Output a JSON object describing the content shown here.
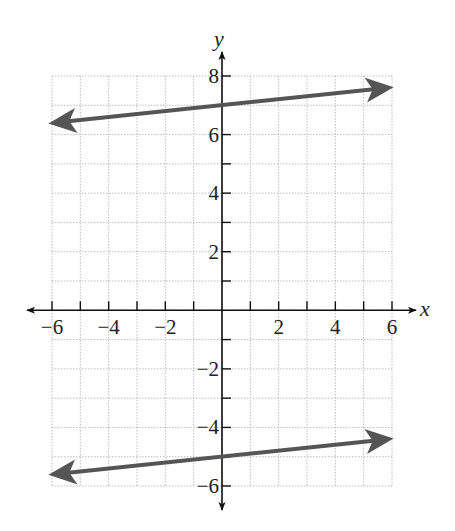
{
  "chart_data": {
    "type": "line",
    "title": "",
    "xlabel": "x",
    "ylabel": "y",
    "xlim": [
      -6,
      6
    ],
    "ylim": [
      -6,
      8
    ],
    "grid": true,
    "grid_step": 1,
    "x_ticks": [
      -6,
      -4,
      -2,
      2,
      4,
      6
    ],
    "y_ticks": [
      -6,
      -4,
      -2,
      2,
      4,
      6,
      8
    ],
    "x_tick_labels": [
      "−6",
      "−4",
      "−2",
      "2",
      "4",
      "6"
    ],
    "y_tick_labels": [
      "−6",
      "−4",
      "−2",
      "2",
      "4",
      "6",
      "8"
    ],
    "series": [
      {
        "name": "line-upper",
        "equation": "y = 0.1x + 7",
        "x": [
          -6,
          6
        ],
        "y": [
          6.4,
          7.6
        ],
        "color": "#555555",
        "arrows": "both"
      },
      {
        "name": "line-lower",
        "equation": "y = 0.1x - 5",
        "x": [
          -6,
          6
        ],
        "y": [
          -5.6,
          -4.4
        ],
        "color": "#555555",
        "arrows": "both"
      }
    ],
    "legend": null
  },
  "colors": {
    "axis": "#111111",
    "grid": "#bdbdbd",
    "line": "#555555"
  }
}
